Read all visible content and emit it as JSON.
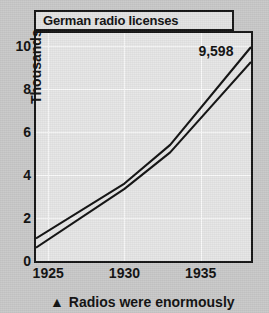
{
  "chart_data": {
    "type": "line",
    "title": "German radio licenses",
    "xlabel": "",
    "ylabel": "Thousands",
    "xlim": [
      1924.2,
      1938.3
    ],
    "ylim": [
      0,
      10.6
    ],
    "grid": true,
    "legend": "none",
    "x_ticks": [
      1925,
      1930,
      1935
    ],
    "x_tick_labels": [
      "1925",
      "1930",
      "1935"
    ],
    "y_ticks": [
      0,
      2,
      4,
      6,
      8,
      10
    ],
    "y_tick_labels": [
      "0",
      "2",
      "4",
      "6",
      "8",
      "10"
    ],
    "annotations": [
      {
        "text": "9,598",
        "x": 1936.0,
        "y": 9.75
      }
    ],
    "series": [
      {
        "name": "upper",
        "x": [
          1924.2,
          1930.0,
          1933.0,
          1938.3
        ],
        "values": [
          1.05,
          3.6,
          5.4,
          9.95
        ]
      },
      {
        "name": "lower",
        "x": [
          1924.2,
          1930.0,
          1933.0,
          1938.3
        ],
        "values": [
          0.62,
          3.35,
          5.05,
          9.25
        ]
      }
    ]
  },
  "caption": {
    "marker": "▲",
    "text": "Radios were enormously"
  }
}
